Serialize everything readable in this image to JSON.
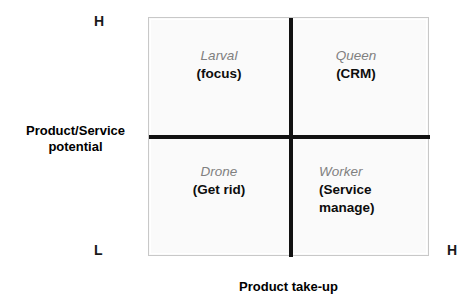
{
  "chart_data": {
    "type": "table",
    "title": "",
    "xlabel": "Product take-up",
    "ylabel": "Product/Service potential",
    "x_axis_ticks": [
      "L",
      "H"
    ],
    "y_axis_ticks": [
      "L",
      "H"
    ],
    "grid": false,
    "legend": "none",
    "layout": "2x2 matrix",
    "categories": [
      "Larval (focus)",
      "Queen (CRM)",
      "Drone (Get rid)",
      "Worker (Service manage)"
    ],
    "cells": [
      {
        "position": "top-left",
        "x_level": "L",
        "y_level": "H",
        "name": "Larval",
        "action": "(focus)"
      },
      {
        "position": "top-right",
        "x_level": "H",
        "y_level": "H",
        "name": "Queen",
        "action": "(CRM)"
      },
      {
        "position": "bottom-left",
        "x_level": "L",
        "y_level": "L",
        "name": "Drone",
        "action": "(Get rid)"
      },
      {
        "position": "bottom-right",
        "x_level": "H",
        "y_level": "L",
        "name": "Worker",
        "action": "(Service manage)"
      }
    ]
  },
  "axes": {
    "y_title_line1": "Product/Service",
    "y_title_line2": "potential",
    "x_title": "Product take-up",
    "y_high_label": "H",
    "y_low_label": "L",
    "x_high_label": "H"
  },
  "quadrants": {
    "larval": {
      "name": "Larval",
      "desc_lines": [
        "(focus)"
      ]
    },
    "queen": {
      "name": "Queen",
      "desc_lines": [
        "(CRM)"
      ]
    },
    "drone": {
      "name": "Drone",
      "desc_lines": [
        "(Get rid)"
      ]
    },
    "worker": {
      "name": "Worker",
      "desc_lines": [
        "(Service",
        "manage)"
      ]
    }
  },
  "colors": {
    "quadrant_fill": "#fafafa",
    "axis_line": "#111111",
    "box_border": "#c8c8c8",
    "name_text": "#808080",
    "desc_text": "#0d0d0d",
    "label_text": "#000000"
  }
}
